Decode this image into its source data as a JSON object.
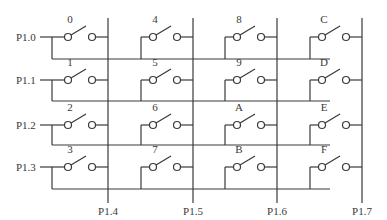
{
  "diagram": {
    "type": "keypad-matrix",
    "rows": [
      {
        "label": "P1.0",
        "y": 37,
        "bus_y": 59
      },
      {
        "label": "P1.1",
        "y": 80,
        "bus_y": 101
      },
      {
        "label": "P1.2",
        "y": 125,
        "bus_y": 145
      },
      {
        "label": "P1.3",
        "y": 167,
        "bus_y": 189
      }
    ],
    "columns": [
      {
        "label": "P1.4",
        "x": 108
      },
      {
        "label": "P1.5",
        "x": 193
      },
      {
        "label": "P1.6",
        "x": 277
      },
      {
        "label": "P1.7",
        "x": 362
      }
    ],
    "keys": [
      [
        "0",
        "4",
        "8",
        "C"
      ],
      [
        "1",
        "5",
        "9",
        "D"
      ],
      [
        "2",
        "6",
        "A",
        "E"
      ],
      [
        "3",
        "7",
        "B",
        "F"
      ]
    ],
    "colors": {
      "line": "#3a3a3a",
      "background": "#ffffff"
    }
  }
}
